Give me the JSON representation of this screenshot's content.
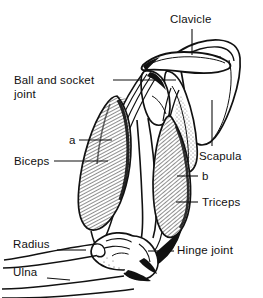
{
  "figure": {
    "style": "black-and-white line drawing with hatched muscle shading",
    "background_color": "#ffffff",
    "line_color": "#111111"
  },
  "labels": [
    {
      "id": "clavicle",
      "text": "Clavicle",
      "x": 170,
      "y": 13,
      "leader": "vertical-line-down"
    },
    {
      "id": "ball-and-socket-joint",
      "text": "Ball and socket\njoint",
      "line1": "Ball and socket",
      "line2": "joint",
      "x": 14,
      "y": 74,
      "leader": "horizontal-line-right"
    },
    {
      "id": "marker-a",
      "text": "a",
      "x": 69,
      "y": 134,
      "leader": "horizontal-line-right"
    },
    {
      "id": "biceps",
      "text": "Biceps",
      "x": 14,
      "y": 155,
      "leader": "horizontal-line-right"
    },
    {
      "id": "scapula",
      "text": "Scapula",
      "x": 199,
      "y": 150,
      "leader": "vertical-line-up"
    },
    {
      "id": "marker-b",
      "text": "b",
      "x": 202,
      "y": 170,
      "leader": "horizontal-line-left"
    },
    {
      "id": "triceps",
      "text": "Triceps",
      "x": 202,
      "y": 196,
      "leader": "horizontal-line-left"
    },
    {
      "id": "radius",
      "text": "Radius",
      "x": 13,
      "y": 238,
      "leader": "horizontal-line-right"
    },
    {
      "id": "hinge-joint",
      "text": "Hinge joint",
      "x": 177,
      "y": 244,
      "leader": "horizontal-line-left"
    },
    {
      "id": "ulna",
      "text": "Ulna",
      "x": 13,
      "y": 266,
      "leader": "horizontal-line-right"
    }
  ],
  "structures": [
    {
      "id": "clavicle-bone",
      "name": "Clavicle"
    },
    {
      "id": "scapula-bone",
      "name": "Scapula"
    },
    {
      "id": "humerus-bone",
      "name": "Humerus"
    },
    {
      "id": "radius-bone",
      "name": "Radius"
    },
    {
      "id": "ulna-bone",
      "name": "Ulna"
    },
    {
      "id": "biceps-muscle",
      "name": "Biceps"
    },
    {
      "id": "triceps-muscle",
      "name": "Triceps"
    },
    {
      "id": "shoulder-ball-and-socket-joint",
      "name": "Ball and socket joint"
    },
    {
      "id": "elbow-hinge-joint",
      "name": "Hinge joint"
    },
    {
      "id": "tendon-a",
      "name": "a"
    },
    {
      "id": "tendon-b",
      "name": "b"
    }
  ]
}
